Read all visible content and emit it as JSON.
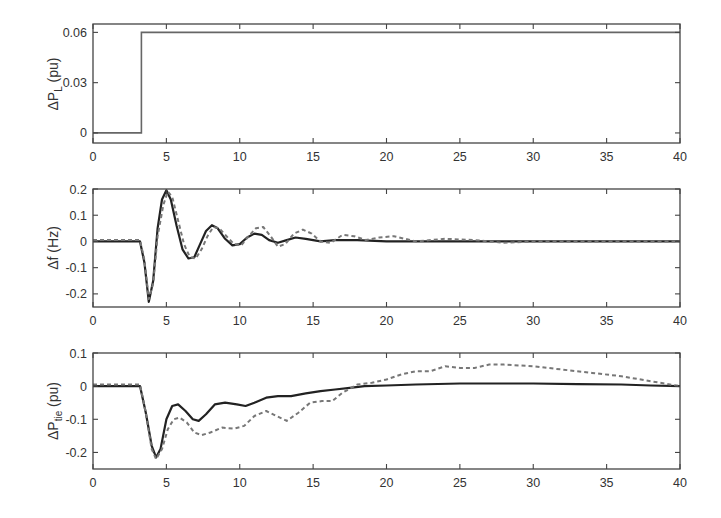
{
  "chart_data": [
    {
      "type": "line",
      "panel": "top",
      "ylabel_main": "ΔP",
      "ylabel_sub": "L",
      "ylabel_unit": " (pu)",
      "xlim": [
        0,
        40
      ],
      "ylim": [
        -0.006,
        0.065
      ],
      "xticks": [
        0,
        5,
        10,
        15,
        20,
        25,
        30,
        35,
        40
      ],
      "yticks": [
        0,
        0.03,
        0.06
      ],
      "ytick_labels": [
        "0",
        "0.03",
        "0.06"
      ],
      "grid": false,
      "series": [
        {
          "name": "load step",
          "style": "thin",
          "x": [
            0,
            3.3,
            3.3,
            40
          ],
          "y": [
            0,
            0,
            0.06,
            0.06
          ]
        }
      ]
    },
    {
      "type": "line",
      "panel": "middle",
      "ylabel_main": "Δf",
      "ylabel_sub": "",
      "ylabel_unit": " (Hz)",
      "xlim": [
        0,
        40
      ],
      "ylim": [
        -0.25,
        0.2
      ],
      "xticks": [
        0,
        5,
        10,
        15,
        20,
        25,
        30,
        35,
        40
      ],
      "yticks": [
        -0.2,
        -0.1,
        0,
        0.1,
        0.2
      ],
      "ytick_labels": [
        "-0.2",
        "-0.1",
        "0",
        "0.1",
        "0.2"
      ],
      "grid": false,
      "series": [
        {
          "name": "solid",
          "style": "solid",
          "x": [
            0,
            3.2,
            3.5,
            3.8,
            4.1,
            4.4,
            4.7,
            5.0,
            5.3,
            5.7,
            6.1,
            6.5,
            6.9,
            7.3,
            7.7,
            8.1,
            8.5,
            9.0,
            9.5,
            10.0,
            10.5,
            11.0,
            11.5,
            12.0,
            12.6,
            13.2,
            13.8,
            14.5,
            15.5,
            16.5,
            18,
            20,
            25,
            30,
            35,
            40
          ],
          "y": [
            0,
            0,
            -0.08,
            -0.23,
            -0.15,
            0.05,
            0.16,
            0.195,
            0.16,
            0.06,
            -0.03,
            -0.065,
            -0.06,
            -0.01,
            0.04,
            0.062,
            0.05,
            0.01,
            -0.015,
            -0.01,
            0.015,
            0.03,
            0.025,
            0.005,
            -0.005,
            0.005,
            0.015,
            0.01,
            0.0,
            0.005,
            0.005,
            0.0,
            0.0,
            0.0,
            0.0,
            0.0
          ]
        },
        {
          "name": "dashed",
          "style": "dashed",
          "x": [
            0,
            3.2,
            3.5,
            3.8,
            4.1,
            4.4,
            4.8,
            5.1,
            5.4,
            5.8,
            6.2,
            6.6,
            7.0,
            7.4,
            7.8,
            8.2,
            8.6,
            9.1,
            9.6,
            10.1,
            10.6,
            11.1,
            11.6,
            12.1,
            12.6,
            13.1,
            13.7,
            14.3,
            14.9,
            15.5,
            16.2,
            17.0,
            17.8,
            18.6,
            19.5,
            20.5,
            22,
            24,
            26,
            28,
            30,
            35,
            40
          ],
          "y": [
            0.005,
            0.005,
            -0.07,
            -0.22,
            -0.16,
            0.02,
            0.14,
            0.19,
            0.17,
            0.08,
            -0.01,
            -0.06,
            -0.065,
            -0.03,
            0.02,
            0.055,
            0.05,
            0.02,
            -0.01,
            -0.015,
            0.02,
            0.05,
            0.055,
            0.02,
            -0.02,
            -0.01,
            0.03,
            0.045,
            0.03,
            0.0,
            -0.005,
            0.025,
            0.02,
            0.005,
            0.015,
            0.02,
            0.0,
            0.01,
            0.005,
            -0.005,
            0.0,
            0.0,
            0.0
          ]
        }
      ]
    },
    {
      "type": "line",
      "panel": "bottom",
      "ylabel_main": "ΔP",
      "ylabel_sub": "tie",
      "ylabel_unit": " (pu)",
      "xlim": [
        0,
        40
      ],
      "ylim": [
        -0.25,
        0.1
      ],
      "xticks": [
        0,
        5,
        10,
        15,
        20,
        25,
        30,
        35,
        40
      ],
      "yticks": [
        -0.2,
        -0.1,
        0,
        0.1
      ],
      "ytick_labels": [
        "-0.2",
        "-0.1",
        "0",
        "0.1"
      ],
      "grid": false,
      "series": [
        {
          "name": "solid",
          "style": "solid",
          "x": [
            0,
            3.2,
            3.6,
            4.0,
            4.3,
            4.6,
            5.0,
            5.4,
            5.8,
            6.3,
            6.8,
            7.2,
            7.7,
            8.3,
            9.0,
            9.8,
            10.4,
            11.0,
            11.8,
            12.6,
            13.5,
            14.5,
            15.5,
            16.5,
            17.5,
            18.5,
            20,
            22,
            25,
            28,
            30,
            33,
            36,
            38,
            40
          ],
          "y": [
            0,
            0,
            -0.08,
            -0.18,
            -0.215,
            -0.19,
            -0.1,
            -0.06,
            -0.055,
            -0.075,
            -0.1,
            -0.105,
            -0.085,
            -0.055,
            -0.05,
            -0.055,
            -0.06,
            -0.05,
            -0.035,
            -0.03,
            -0.03,
            -0.022,
            -0.015,
            -0.01,
            -0.005,
            0.0,
            0.002,
            0.005,
            0.008,
            0.008,
            0.008,
            0.006,
            0.005,
            0.002,
            0.0
          ]
        },
        {
          "name": "dashed",
          "style": "dashed",
          "x": [
            0,
            3.2,
            3.6,
            4.0,
            4.3,
            4.7,
            5.1,
            5.5,
            5.9,
            6.4,
            6.9,
            7.4,
            8.0,
            8.8,
            9.6,
            10.3,
            11.0,
            11.8,
            12.5,
            13.2,
            14.0,
            14.8,
            15.6,
            16.3,
            17.0,
            18.0,
            19.0,
            20.0,
            21.0,
            22.0,
            23.0,
            24.0,
            25.0,
            26.0,
            27.0,
            28.0,
            30.0,
            32.0,
            34.0,
            36.0,
            38.0,
            40.0
          ],
          "y": [
            0.005,
            0.005,
            -0.08,
            -0.19,
            -0.22,
            -0.19,
            -0.13,
            -0.1,
            -0.095,
            -0.11,
            -0.14,
            -0.148,
            -0.14,
            -0.125,
            -0.128,
            -0.12,
            -0.09,
            -0.075,
            -0.09,
            -0.105,
            -0.08,
            -0.05,
            -0.045,
            -0.045,
            -0.02,
            0.005,
            0.01,
            0.02,
            0.035,
            0.045,
            0.045,
            0.06,
            0.055,
            0.055,
            0.065,
            0.065,
            0.06,
            0.05,
            0.04,
            0.03,
            0.015,
            0.0
          ]
        }
      ]
    }
  ],
  "layout": {
    "plot_left": 93,
    "plot_right": 680,
    "panels": [
      {
        "top": 24,
        "bottom": 143
      },
      {
        "top": 189,
        "bottom": 307
      },
      {
        "top": 353,
        "bottom": 469
      }
    ]
  }
}
